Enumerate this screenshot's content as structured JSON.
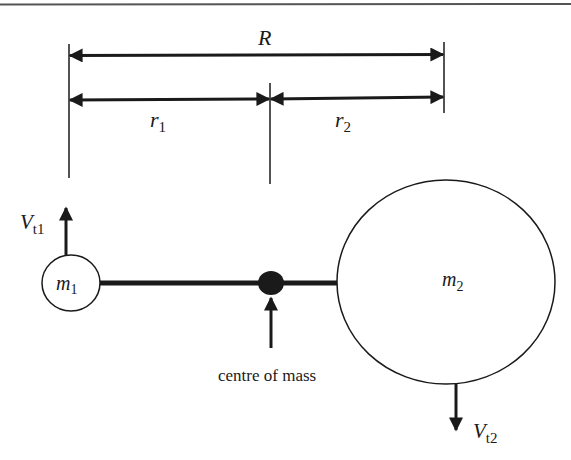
{
  "figure": {
    "type": "two-body orbital diagram",
    "colors": {
      "ink": "#1a1a1a",
      "background": "#ffffff",
      "rule": "#555555"
    },
    "dimensions": {
      "total_separation": {
        "symbol": "R"
      },
      "r1": {
        "symbol": "r",
        "subscript": "1"
      },
      "r2": {
        "symbol": "r",
        "subscript": "2"
      }
    },
    "bodies": {
      "m1": {
        "symbol": "m",
        "subscript": "1",
        "size": "small"
      },
      "m2": {
        "symbol": "m",
        "subscript": "2",
        "size": "large"
      }
    },
    "velocities": {
      "vt1": {
        "symbol": "V",
        "subscript": "t1",
        "direction": "up"
      },
      "vt2": {
        "symbol": "V",
        "subscript": "t2",
        "direction": "down"
      }
    },
    "centre_of_mass": {
      "label": "centre of mass"
    }
  }
}
